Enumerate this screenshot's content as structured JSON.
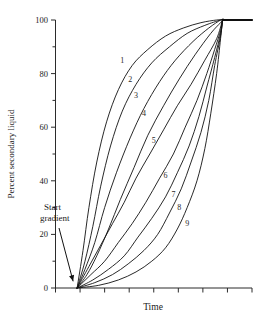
{
  "chart_data": {
    "type": "line",
    "title": "",
    "xlabel": "Time",
    "ylabel": "Percent secondary liquid",
    "xlim": [
      0,
      100
    ],
    "ylim": [
      0,
      100
    ],
    "grid": false,
    "legend_position": "inline-curve-labels",
    "y_ticks_major": [
      0,
      20,
      40,
      60,
      80,
      100
    ],
    "y_ticks_major_labels": [
      "0",
      "20",
      "40",
      "60",
      "80",
      "100"
    ],
    "y_ticks_minor": [
      10,
      30,
      50,
      70,
      90
    ],
    "x_ticks_major": [
      0,
      12.5,
      25,
      37.5,
      50,
      62.5,
      75,
      87.5,
      100
    ],
    "x_tick_labels": [
      "",
      "",
      "",
      "",
      "",
      "",
      "",
      "",
      ""
    ],
    "annotations": [
      {
        "name": "start-gradient",
        "text_line1": "Start",
        "text_line2": "gradient",
        "points_to_x": 11,
        "points_to_y": 1
      }
    ],
    "series": [
      {
        "name": "1",
        "label": "1",
        "curvature": -3.0,
        "label_x": 34,
        "label_y": 84,
        "x": [
          11,
          14,
          17,
          21,
          26,
          32,
          39,
          47,
          56,
          65,
          74,
          82,
          85,
          85
        ],
        "y": [
          0,
          14,
          30,
          47,
          62,
          74,
          83,
          89,
          94,
          97,
          99,
          100,
          100,
          100
        ]
      },
      {
        "name": "2",
        "label": "2",
        "curvature": -2.25,
        "label_x": 38,
        "label_y": 77,
        "x": [
          11,
          15,
          19,
          23,
          28,
          34,
          41,
          49,
          58,
          67,
          76,
          84,
          85,
          85
        ],
        "y": [
          0,
          10,
          23,
          38,
          53,
          66,
          76,
          84,
          90,
          95,
          98,
          100,
          100,
          100
        ]
      },
      {
        "name": "3",
        "label": "3",
        "curvature": -1.55,
        "label_x": 41,
        "label_y": 71,
        "x": [
          11,
          15,
          20,
          25,
          31,
          38,
          45,
          53,
          61,
          70,
          78,
          84,
          85,
          85
        ],
        "y": [
          0,
          7,
          17,
          30,
          43,
          56,
          67,
          77,
          85,
          92,
          97,
          100,
          100,
          100
        ]
      },
      {
        "name": "4",
        "label": "4",
        "curvature": -0.85,
        "label_x": 45,
        "label_y": 64,
        "x": [
          11,
          16,
          21,
          27,
          33,
          40,
          47,
          55,
          63,
          71,
          79,
          84,
          85,
          85
        ],
        "y": [
          0,
          5,
          12,
          22,
          33,
          45,
          57,
          68,
          78,
          87,
          95,
          99,
          100,
          100
        ]
      },
      {
        "name": "5",
        "label": "5",
        "curvature": 0.0,
        "label_x": 50,
        "label_y": 54,
        "x": [
          11,
          17,
          23,
          29,
          35,
          41,
          48,
          55,
          62,
          69,
          76,
          82,
          85,
          85
        ],
        "y": [
          0,
          8,
          16,
          24,
          32,
          41,
          50,
          59,
          68,
          76,
          85,
          93,
          100,
          100
        ]
      },
      {
        "name": "6",
        "label": "6",
        "curvature": 0.85,
        "label_x": 56,
        "label_y": 41,
        "x": [
          11,
          18,
          25,
          32,
          39,
          46,
          53,
          60,
          66,
          72,
          77,
          81,
          84,
          85
        ],
        "y": [
          0,
          5,
          10,
          17,
          24,
          32,
          41,
          50,
          60,
          70,
          80,
          89,
          96,
          100
        ]
      },
      {
        "name": "7",
        "label": "7",
        "curvature": 1.55,
        "label_x": 60,
        "label_y": 34,
        "x": [
          11,
          19,
          27,
          35,
          42,
          49,
          56,
          62,
          68,
          73,
          77,
          81,
          84,
          85
        ],
        "y": [
          0,
          3,
          7,
          12,
          19,
          26,
          34,
          43,
          53,
          64,
          75,
          86,
          95,
          100
        ]
      },
      {
        "name": "8",
        "label": "8",
        "curvature": 2.25,
        "label_x": 63,
        "label_y": 29,
        "x": [
          11,
          20,
          29,
          37,
          45,
          52,
          58,
          64,
          69,
          74,
          78,
          81,
          84,
          85
        ],
        "y": [
          0,
          2,
          5,
          9,
          14,
          20,
          28,
          37,
          47,
          58,
          70,
          83,
          94,
          100
        ]
      },
      {
        "name": "9",
        "label": "9",
        "curvature": 3.0,
        "label_x": 67,
        "label_y": 23,
        "x": [
          11,
          22,
          32,
          41,
          49,
          56,
          62,
          67,
          72,
          76,
          79,
          82,
          84,
          85
        ],
        "y": [
          0,
          1,
          3,
          6,
          10,
          15,
          22,
          30,
          40,
          52,
          65,
          80,
          93,
          100
        ]
      }
    ],
    "plateau": {
      "from_x": 85,
      "to_x": 100,
      "y": 100
    }
  }
}
